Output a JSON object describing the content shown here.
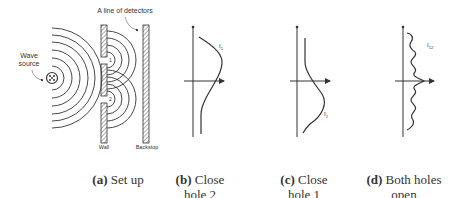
{
  "setup": {
    "source_label_line1": "Wave",
    "source_label_line2": "source",
    "detectors_label": "A line of detectors",
    "wall_label": "Wall",
    "backstop_label": "Backstop",
    "hole_labels": [
      "1",
      "2"
    ]
  },
  "plots": [
    {
      "id": "b",
      "curve_label": "I",
      "curve_sub": "1"
    },
    {
      "id": "c",
      "curve_label": "I",
      "curve_sub": "2"
    },
    {
      "id": "d",
      "curve_label": "I",
      "curve_sub": "12"
    }
  ],
  "captions": [
    {
      "letter": "(a)",
      "text_line1": "Set up",
      "text_line2": ""
    },
    {
      "letter": "(b)",
      "text_line1": "Close",
      "text_line2": "hole 2"
    },
    {
      "letter": "(c)",
      "text_line1": "Close",
      "text_line2": "hole 1"
    },
    {
      "letter": "(d)",
      "text_line1": "Both holes",
      "text_line2": "open"
    }
  ],
  "colors": {
    "line": "#333333",
    "hatch": "#555555"
  }
}
